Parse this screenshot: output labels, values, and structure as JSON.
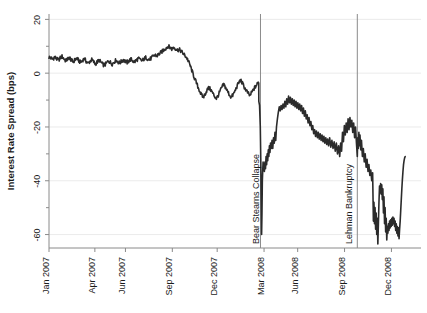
{
  "chart_data": {
    "type": "line",
    "title": "",
    "xlabel": "",
    "ylabel": "Interest Rate Spread (bps)",
    "ylim": [
      -65,
      22
    ],
    "xlim": [
      "2007-01-01",
      "2008-12-31"
    ],
    "yticks": [
      20,
      0,
      -20,
      -40,
      -60
    ],
    "ytick_labels": [
      "20",
      "0",
      "-20",
      "-40",
      "-60"
    ],
    "yminor_ticks": [
      10,
      -10,
      -30,
      -50
    ],
    "grid": "horizontal",
    "legend": "none",
    "xtick_labels": [
      "Jan 2007",
      "Apr 2007",
      "Jun 2007",
      "Sep 2007",
      "Dec 2007",
      "Mar 2008",
      "Jun 2008",
      "Sep 2008",
      "Dec 2008"
    ],
    "xtick_positions": [
      0.0,
      0.1233,
      0.2055,
      0.3315,
      0.4521,
      0.5781,
      0.6685,
      0.7945,
      0.9205
    ],
    "annotations": [
      {
        "label": "Bear Stearns Collapse",
        "x_position": 0.5685,
        "orientation": "vertical",
        "line": true
      },
      {
        "label": "Lehman Bankruptcy",
        "x_position": 0.8288,
        "orientation": "vertical",
        "line": true
      }
    ],
    "series": [
      {
        "name": "Interest Rate Spread",
        "color": "#2b2b2b",
        "x": [
          0.0,
          0.005,
          0.01,
          0.015,
          0.02,
          0.025,
          0.03,
          0.035,
          0.04,
          0.045,
          0.05,
          0.055,
          0.06,
          0.065,
          0.07,
          0.075,
          0.08,
          0.085,
          0.09,
          0.095,
          0.1,
          0.105,
          0.11,
          0.115,
          0.12,
          0.125,
          0.13,
          0.135,
          0.14,
          0.145,
          0.15,
          0.155,
          0.16,
          0.165,
          0.17,
          0.175,
          0.18,
          0.185,
          0.19,
          0.195,
          0.2,
          0.205,
          0.21,
          0.215,
          0.22,
          0.225,
          0.23,
          0.235,
          0.24,
          0.245,
          0.25,
          0.255,
          0.26,
          0.265,
          0.27,
          0.275,
          0.28,
          0.285,
          0.29,
          0.295,
          0.3,
          0.305,
          0.31,
          0.315,
          0.32,
          0.325,
          0.33,
          0.335,
          0.34,
          0.345,
          0.35,
          0.355,
          0.36,
          0.365,
          0.37,
          0.375,
          0.38,
          0.385,
          0.39,
          0.395,
          0.4,
          0.405,
          0.41,
          0.415,
          0.42,
          0.425,
          0.43,
          0.435,
          0.44,
          0.445,
          0.45,
          0.455,
          0.46,
          0.465,
          0.47,
          0.475,
          0.48,
          0.485,
          0.49,
          0.495,
          0.5,
          0.505,
          0.51,
          0.515,
          0.52,
          0.525,
          0.53,
          0.535,
          0.54,
          0.545,
          0.55,
          0.555,
          0.56,
          0.565,
          0.568,
          0.57,
          0.572,
          0.575,
          0.578,
          0.58,
          0.583,
          0.586,
          0.59,
          0.594,
          0.598,
          0.602,
          0.606,
          0.61,
          0.614,
          0.618,
          0.622,
          0.626,
          0.63,
          0.634,
          0.638,
          0.642,
          0.646,
          0.65,
          0.654,
          0.658,
          0.662,
          0.666,
          0.67,
          0.674,
          0.678,
          0.682,
          0.686,
          0.69,
          0.694,
          0.698,
          0.702,
          0.706,
          0.71,
          0.714,
          0.718,
          0.722,
          0.726,
          0.73,
          0.734,
          0.738,
          0.742,
          0.746,
          0.75,
          0.754,
          0.758,
          0.762,
          0.766,
          0.77,
          0.774,
          0.778,
          0.782,
          0.786,
          0.79,
          0.794,
          0.798,
          0.802,
          0.806,
          0.81,
          0.814,
          0.818,
          0.822,
          0.826,
          0.829,
          0.832,
          0.836,
          0.84,
          0.844,
          0.848,
          0.852,
          0.856,
          0.86,
          0.864,
          0.868,
          0.872,
          0.876,
          0.88,
          0.884,
          0.888,
          0.892,
          0.896,
          0.9,
          0.904,
          0.908,
          0.912,
          0.916,
          0.92,
          0.924,
          0.928,
          0.932,
          0.936,
          0.94,
          0.944,
          0.948,
          0.952,
          0.956,
          0.96,
          0.964,
          0.968,
          0.972,
          0.976,
          0.98,
          0.984,
          0.988,
          0.992,
          0.996,
          1.0
        ],
        "y": [
          6.0,
          5.6,
          5.2,
          6.0,
          5.4,
          4.8,
          5.6,
          6.2,
          5.4,
          4.6,
          5.2,
          5.8,
          4.8,
          4.2,
          5.0,
          5.6,
          4.6,
          4.0,
          4.8,
          5.4,
          4.4,
          3.6,
          4.4,
          5.0,
          4.2,
          3.4,
          4.2,
          4.8,
          4.0,
          3.2,
          3.0,
          3.8,
          4.6,
          4.0,
          3.4,
          4.2,
          4.8,
          4.2,
          3.8,
          4.4,
          5.0,
          4.4,
          4.0,
          4.6,
          5.2,
          4.6,
          4.2,
          4.8,
          5.4,
          5.0,
          4.6,
          5.2,
          5.8,
          5.4,
          5.0,
          5.6,
          6.2,
          6.8,
          6.4,
          7.0,
          7.6,
          8.2,
          8.8,
          9.4,
          10.0,
          9.6,
          9.0,
          9.6,
          9.2,
          8.6,
          8.8,
          8.2,
          7.4,
          6.6,
          5.8,
          4.4,
          2.6,
          0.6,
          -1.4,
          -3.2,
          -5.0,
          -6.6,
          -8.2,
          -9.0,
          -7.6,
          -6.2,
          -5.4,
          -6.2,
          -7.4,
          -8.6,
          -9.4,
          -8.2,
          -6.6,
          -5.2,
          -4.2,
          -5.4,
          -6.8,
          -8.0,
          -9.0,
          -8.0,
          -6.6,
          -5.0,
          -3.6,
          -2.6,
          -3.8,
          -5.2,
          -6.4,
          -7.4,
          -8.4,
          -7.2,
          -6.0,
          -5.0,
          -4.0,
          -3.0,
          -4.2,
          -5.6,
          -7.0,
          -8.2,
          -9.2,
          -10.0,
          -10.6,
          -11.2,
          -10.2,
          -9.0,
          -8.0,
          -8.8,
          -9.8,
          -10.8,
          -11.6,
          -10.6,
          -9.4,
          -8.4,
          -7.6,
          -8.6,
          -9.6,
          -10.4,
          -11.2,
          -10.2,
          -9.2,
          -8.4,
          -9.2,
          -10.2,
          -11.0,
          -10.0,
          -9.0,
          -8.2,
          -8.8,
          -9.6,
          -10.4,
          -9.6,
          -8.8,
          -9.4,
          -10.2,
          -10.8,
          -10.0,
          -9.2,
          -9.8,
          -10.6,
          -11.2,
          -10.4,
          -9.6,
          -10.2,
          -11.0,
          -11.6,
          -10.8,
          -10.0,
          -10.6,
          -11.2,
          -11.8,
          -11.0,
          -10.4,
          -11.0,
          -11.6,
          -12.2,
          -11.4,
          -10.8,
          -11.4,
          -12.0,
          -12.6,
          -12.0,
          -11.4,
          -11.8,
          -12.4,
          -13.0,
          -12.2,
          -11.6,
          -12.2,
          -12.8,
          -13.4,
          -12.6,
          -12.0,
          -12.6,
          -13.2,
          -13.8,
          -13.0,
          -12.4,
          -13.0,
          -13.6,
          -14.2,
          -13.4,
          -13.8,
          -14.4,
          -15.0,
          -14.2,
          -13.6,
          -14.2,
          -14.8,
          -15.4,
          -14.6,
          -14.0,
          -14.6,
          -15.2,
          -15.8,
          -15.0,
          -14.4,
          -15.0,
          -15.6,
          -16.2,
          -15.4,
          -14.8,
          -15.4,
          -16.0,
          -16.6,
          -15.8,
          -15.2,
          -16.0
        ],
        "key_features": [
          {
            "date": "2007-01",
            "value": 6,
            "note": "start near +6 bps"
          },
          {
            "date": "2007-06",
            "value": 10,
            "note": "2007 peak ~ +10 bps"
          },
          {
            "date": "2007-08",
            "value": -9,
            "note": "sharp drop into negative territory"
          },
          {
            "date": "2008-03",
            "value": -60,
            "note": "Bear Stearns collapse trough"
          },
          {
            "date": "2008-05",
            "value": -8,
            "note": "post-Bear recovery peak"
          },
          {
            "date": "2008-09",
            "value": -16,
            "note": "Lehman bankruptcy"
          },
          {
            "date": "2008-11",
            "value": -64,
            "note": "post-Lehman trough"
          },
          {
            "date": "2008-12",
            "value": -31,
            "note": "end of series"
          }
        ]
      }
    ]
  },
  "axes": {
    "y_axis_label": "Interest Rate Spread (bps)",
    "y_tick_labels": [
      "20",
      "0",
      "-20",
      "-40",
      "-60"
    ],
    "x_tick_labels": [
      "Jan 2007",
      "Apr 2007",
      "Jun 2007",
      "Sep 2007",
      "Dec 2007",
      "Mar 2008",
      "Jun 2008",
      "Sep 2008",
      "Dec 2008"
    ]
  },
  "annotations": {
    "bear_stearns": "Bear Stearns Collapse",
    "lehman": "Lehman Bankruptcy"
  },
  "colors": {
    "line": "#2b2b2b",
    "grid": "#e2e2e2",
    "axis": "#8a8a8a",
    "text": "#1a1a1a",
    "background": "#ffffff"
  }
}
